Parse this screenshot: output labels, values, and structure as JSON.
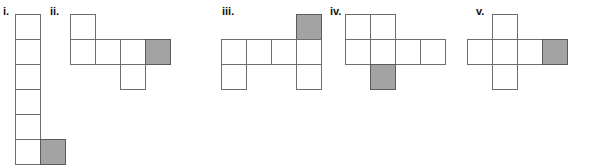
{
  "page": {
    "background_color": "#ffffff",
    "cell_size_px": 26,
    "colors": {
      "cell_fill": "#ffffff",
      "cell_stroke": "#6e6e6e",
      "shaded_fill": "#a3a3a3",
      "shaded_stroke": "#5a5a5a",
      "label_color": "#111111"
    }
  },
  "figures": [
    {
      "id": "figure-i",
      "label": "i.",
      "label_x": 3,
      "label_y": 6,
      "origin_x": 15,
      "origin_y": 14,
      "cols": 2,
      "rows": 6,
      "cells": [
        {
          "row": 0,
          "col": 0,
          "shaded": false
        },
        {
          "row": 1,
          "col": 0,
          "shaded": false
        },
        {
          "row": 2,
          "col": 0,
          "shaded": false
        },
        {
          "row": 3,
          "col": 0,
          "shaded": false
        },
        {
          "row": 4,
          "col": 0,
          "shaded": false
        },
        {
          "row": 5,
          "col": 0,
          "shaded": false
        },
        {
          "row": 5,
          "col": 1,
          "shaded": true
        }
      ]
    },
    {
      "id": "figure-ii",
      "label": "ii.",
      "label_x": 50,
      "label_y": 6,
      "origin_x": 70,
      "origin_y": 14,
      "cols": 4,
      "rows": 3,
      "cells": [
        {
          "row": 0,
          "col": 0,
          "shaded": false
        },
        {
          "row": 1,
          "col": 0,
          "shaded": false
        },
        {
          "row": 1,
          "col": 1,
          "shaded": false
        },
        {
          "row": 1,
          "col": 2,
          "shaded": false
        },
        {
          "row": 1,
          "col": 3,
          "shaded": true
        },
        {
          "row": 2,
          "col": 2,
          "shaded": false
        }
      ]
    },
    {
      "id": "figure-iii",
      "label": "iii.",
      "label_x": 222,
      "label_y": 6,
      "origin_x": 221,
      "origin_y": 14,
      "cols": 4,
      "rows": 3,
      "cells": [
        {
          "row": 0,
          "col": 3,
          "shaded": true
        },
        {
          "row": 1,
          "col": 0,
          "shaded": false
        },
        {
          "row": 1,
          "col": 1,
          "shaded": false
        },
        {
          "row": 1,
          "col": 2,
          "shaded": false
        },
        {
          "row": 1,
          "col": 3,
          "shaded": false
        },
        {
          "row": 2,
          "col": 0,
          "shaded": false
        },
        {
          "row": 2,
          "col": 3,
          "shaded": false
        }
      ]
    },
    {
      "id": "figure-iv",
      "label": "iv.",
      "label_x": 330,
      "label_y": 6,
      "origin_x": 345,
      "origin_y": 14,
      "cols": 4,
      "rows": 3,
      "cells": [
        {
          "row": 0,
          "col": 0,
          "shaded": false
        },
        {
          "row": 0,
          "col": 1,
          "shaded": false
        },
        {
          "row": 1,
          "col": 0,
          "shaded": false
        },
        {
          "row": 1,
          "col": 1,
          "shaded": false
        },
        {
          "row": 1,
          "col": 2,
          "shaded": false
        },
        {
          "row": 1,
          "col": 3,
          "shaded": false
        },
        {
          "row": 2,
          "col": 1,
          "shaded": true
        }
      ]
    },
    {
      "id": "figure-v",
      "label": "v.",
      "label_x": 476,
      "label_y": 6,
      "origin_x": 467,
      "origin_y": 14,
      "cols": 4,
      "rows": 3,
      "cells": [
        {
          "row": 0,
          "col": 1,
          "shaded": false
        },
        {
          "row": 1,
          "col": 0,
          "shaded": false
        },
        {
          "row": 1,
          "col": 1,
          "shaded": false
        },
        {
          "row": 1,
          "col": 2,
          "shaded": false
        },
        {
          "row": 1,
          "col": 3,
          "shaded": true
        },
        {
          "row": 2,
          "col": 1,
          "shaded": false
        }
      ]
    }
  ]
}
